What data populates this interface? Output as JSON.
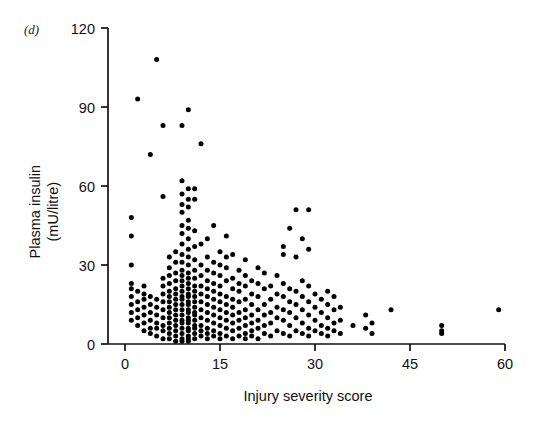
{
  "figure": {
    "panel_label": "(d)",
    "background": "#ffffff",
    "marker_color": "#000000",
    "axis_color": "#111111"
  },
  "chart_data": {
    "type": "scatter",
    "title": "",
    "xlabel": "Injury severity score",
    "ylabel": "Plasma insulin (mU/litre)",
    "ylabel_line1": "Plasma insulin",
    "ylabel_line2": "(mU/litre)",
    "xlim": [
      0,
      60
    ],
    "ylim": [
      0,
      120
    ],
    "xticks": [
      0,
      15,
      30,
      45,
      60
    ],
    "yticks": [
      0,
      30,
      60,
      90,
      120
    ],
    "xticklabels": [
      "0",
      "15",
      "30",
      "45",
      "60"
    ],
    "yticklabels": [
      "0",
      "30",
      "60",
      "90",
      "120"
    ],
    "grid": false,
    "legend": null,
    "marker": "filled-circle",
    "marker_size_px": 5,
    "n_points": 322,
    "points": [
      [
        1,
        9
      ],
      [
        1,
        12
      ],
      [
        1,
        15
      ],
      [
        1,
        18
      ],
      [
        1,
        21
      ],
      [
        1,
        23
      ],
      [
        1,
        30
      ],
      [
        1,
        41
      ],
      [
        1,
        48
      ],
      [
        2,
        7
      ],
      [
        2,
        10
      ],
      [
        2,
        13
      ],
      [
        2,
        16
      ],
      [
        2,
        20
      ],
      [
        2,
        93
      ],
      [
        3,
        5
      ],
      [
        3,
        8
      ],
      [
        3,
        11
      ],
      [
        3,
        14
      ],
      [
        3,
        17
      ],
      [
        3,
        19
      ],
      [
        3,
        22
      ],
      [
        4,
        4
      ],
      [
        4,
        6
      ],
      [
        4,
        9
      ],
      [
        4,
        12
      ],
      [
        4,
        15
      ],
      [
        4,
        18
      ],
      [
        4,
        72
      ],
      [
        5,
        3
      ],
      [
        5,
        6
      ],
      [
        5,
        8
      ],
      [
        5,
        11
      ],
      [
        5,
        14
      ],
      [
        5,
        17
      ],
      [
        5,
        108
      ],
      [
        6,
        2
      ],
      [
        6,
        5
      ],
      [
        6,
        7
      ],
      [
        6,
        10
      ],
      [
        6,
        13
      ],
      [
        6,
        16
      ],
      [
        6,
        19
      ],
      [
        6,
        22
      ],
      [
        6,
        25
      ],
      [
        6,
        56
      ],
      [
        6,
        83
      ],
      [
        7,
        2
      ],
      [
        7,
        4
      ],
      [
        7,
        6
      ],
      [
        7,
        8
      ],
      [
        7,
        10
      ],
      [
        7,
        12
      ],
      [
        7,
        14
      ],
      [
        7,
        16
      ],
      [
        7,
        18
      ],
      [
        7,
        20
      ],
      [
        7,
        23
      ],
      [
        7,
        26
      ],
      [
        7,
        29
      ],
      [
        7,
        33
      ],
      [
        8,
        1
      ],
      [
        8,
        3
      ],
      [
        8,
        5
      ],
      [
        8,
        7
      ],
      [
        8,
        9
      ],
      [
        8,
        11
      ],
      [
        8,
        13
      ],
      [
        8,
        15
      ],
      [
        8,
        17
      ],
      [
        8,
        19
      ],
      [
        8,
        21
      ],
      [
        8,
        24
      ],
      [
        8,
        27
      ],
      [
        8,
        31
      ],
      [
        8,
        35
      ],
      [
        9,
        1
      ],
      [
        9,
        2
      ],
      [
        9,
        4
      ],
      [
        9,
        6
      ],
      [
        9,
        8
      ],
      [
        9,
        9
      ],
      [
        9,
        11
      ],
      [
        9,
        13
      ],
      [
        9,
        15
      ],
      [
        9,
        17
      ],
      [
        9,
        18
      ],
      [
        9,
        20
      ],
      [
        9,
        22
      ],
      [
        9,
        24
      ],
      [
        9,
        26
      ],
      [
        9,
        28
      ],
      [
        9,
        31
      ],
      [
        9,
        34
      ],
      [
        9,
        38
      ],
      [
        9,
        42
      ],
      [
        9,
        45
      ],
      [
        9,
        50
      ],
      [
        9,
        53
      ],
      [
        9,
        57
      ],
      [
        9,
        62
      ],
      [
        9,
        83
      ],
      [
        10,
        1
      ],
      [
        10,
        2
      ],
      [
        10,
        3
      ],
      [
        10,
        5
      ],
      [
        10,
        6
      ],
      [
        10,
        8
      ],
      [
        10,
        9
      ],
      [
        10,
        10
      ],
      [
        10,
        12
      ],
      [
        10,
        13
      ],
      [
        10,
        15
      ],
      [
        10,
        16
      ],
      [
        10,
        18
      ],
      [
        10,
        19
      ],
      [
        10,
        21
      ],
      [
        10,
        23
      ],
      [
        10,
        25
      ],
      [
        10,
        27
      ],
      [
        10,
        30
      ],
      [
        10,
        33
      ],
      [
        10,
        36
      ],
      [
        10,
        40
      ],
      [
        10,
        44
      ],
      [
        10,
        47
      ],
      [
        10,
        52
      ],
      [
        10,
        55
      ],
      [
        10,
        59
      ],
      [
        10,
        89
      ],
      [
        11,
        2
      ],
      [
        11,
        4
      ],
      [
        11,
        6
      ],
      [
        11,
        7
      ],
      [
        11,
        9
      ],
      [
        11,
        11
      ],
      [
        11,
        12
      ],
      [
        11,
        14
      ],
      [
        11,
        16
      ],
      [
        11,
        18
      ],
      [
        11,
        20
      ],
      [
        11,
        22
      ],
      [
        11,
        25
      ],
      [
        11,
        28
      ],
      [
        11,
        32
      ],
      [
        11,
        37
      ],
      [
        11,
        43
      ],
      [
        11,
        55
      ],
      [
        11,
        59
      ],
      [
        12,
        3
      ],
      [
        12,
        5
      ],
      [
        12,
        7
      ],
      [
        12,
        10
      ],
      [
        12,
        13
      ],
      [
        12,
        16
      ],
      [
        12,
        19
      ],
      [
        12,
        22
      ],
      [
        12,
        26
      ],
      [
        12,
        30
      ],
      [
        12,
        38
      ],
      [
        12,
        76
      ],
      [
        13,
        2
      ],
      [
        13,
        4
      ],
      [
        13,
        6
      ],
      [
        13,
        9
      ],
      [
        13,
        12
      ],
      [
        13,
        15
      ],
      [
        13,
        18
      ],
      [
        13,
        21
      ],
      [
        13,
        24
      ],
      [
        13,
        28
      ],
      [
        13,
        33
      ],
      [
        13,
        40
      ],
      [
        14,
        3
      ],
      [
        14,
        5
      ],
      [
        14,
        8
      ],
      [
        14,
        11
      ],
      [
        14,
        14
      ],
      [
        14,
        17
      ],
      [
        14,
        20
      ],
      [
        14,
        23
      ],
      [
        14,
        27
      ],
      [
        14,
        31
      ],
      [
        14,
        45
      ],
      [
        15,
        2
      ],
      [
        15,
        4
      ],
      [
        15,
        7
      ],
      [
        15,
        10
      ],
      [
        15,
        13
      ],
      [
        15,
        16
      ],
      [
        15,
        19
      ],
      [
        15,
        22
      ],
      [
        15,
        26
      ],
      [
        15,
        30
      ],
      [
        15,
        35
      ],
      [
        16,
        3
      ],
      [
        16,
        6
      ],
      [
        16,
        9
      ],
      [
        16,
        12
      ],
      [
        16,
        15
      ],
      [
        16,
        18
      ],
      [
        16,
        24
      ],
      [
        16,
        29
      ],
      [
        16,
        33
      ],
      [
        16,
        41
      ],
      [
        17,
        2
      ],
      [
        17,
        5
      ],
      [
        17,
        8
      ],
      [
        17,
        11
      ],
      [
        17,
        14
      ],
      [
        17,
        17
      ],
      [
        17,
        21
      ],
      [
        17,
        25
      ],
      [
        17,
        34
      ],
      [
        18,
        3
      ],
      [
        18,
        6
      ],
      [
        18,
        9
      ],
      [
        18,
        12
      ],
      [
        18,
        16
      ],
      [
        18,
        20
      ],
      [
        18,
        23
      ],
      [
        18,
        28
      ],
      [
        19,
        2
      ],
      [
        19,
        4
      ],
      [
        19,
        7
      ],
      [
        19,
        10
      ],
      [
        19,
        13
      ],
      [
        19,
        17
      ],
      [
        19,
        22
      ],
      [
        19,
        26
      ],
      [
        19,
        32
      ],
      [
        20,
        3
      ],
      [
        20,
        5
      ],
      [
        20,
        8
      ],
      [
        20,
        11
      ],
      [
        20,
        15
      ],
      [
        20,
        19
      ],
      [
        20,
        24
      ],
      [
        21,
        2
      ],
      [
        21,
        6
      ],
      [
        21,
        9
      ],
      [
        21,
        13
      ],
      [
        21,
        18
      ],
      [
        21,
        23
      ],
      [
        21,
        29
      ],
      [
        22,
        4
      ],
      [
        22,
        7
      ],
      [
        22,
        11
      ],
      [
        22,
        15
      ],
      [
        22,
        21
      ],
      [
        22,
        27
      ],
      [
        23,
        3
      ],
      [
        23,
        8
      ],
      [
        23,
        12
      ],
      [
        23,
        17
      ],
      [
        23,
        22
      ],
      [
        24,
        5
      ],
      [
        24,
        10
      ],
      [
        24,
        14
      ],
      [
        24,
        19
      ],
      [
        24,
        26
      ],
      [
        25,
        4
      ],
      [
        25,
        9
      ],
      [
        25,
        13
      ],
      [
        25,
        18
      ],
      [
        25,
        23
      ],
      [
        25,
        34
      ],
      [
        25,
        37
      ],
      [
        26,
        3
      ],
      [
        26,
        7
      ],
      [
        26,
        12
      ],
      [
        26,
        16
      ],
      [
        26,
        21
      ],
      [
        26,
        44
      ],
      [
        27,
        5
      ],
      [
        27,
        10
      ],
      [
        27,
        15
      ],
      [
        27,
        20
      ],
      [
        27,
        33
      ],
      [
        27,
        51
      ],
      [
        28,
        4
      ],
      [
        28,
        8
      ],
      [
        28,
        13
      ],
      [
        28,
        18
      ],
      [
        28,
        24
      ],
      [
        28,
        40
      ],
      [
        29,
        3
      ],
      [
        29,
        6
      ],
      [
        29,
        11
      ],
      [
        29,
        16
      ],
      [
        29,
        22
      ],
      [
        29,
        36
      ],
      [
        29,
        51
      ],
      [
        30,
        5
      ],
      [
        30,
        9
      ],
      [
        30,
        14
      ],
      [
        30,
        19
      ],
      [
        31,
        4
      ],
      [
        31,
        7
      ],
      [
        31,
        12
      ],
      [
        31,
        17
      ],
      [
        32,
        3
      ],
      [
        32,
        6
      ],
      [
        32,
        10
      ],
      [
        32,
        15
      ],
      [
        32,
        20
      ],
      [
        33,
        5
      ],
      [
        33,
        8
      ],
      [
        33,
        13
      ],
      [
        33,
        18
      ],
      [
        34,
        4
      ],
      [
        34,
        9
      ],
      [
        34,
        14
      ],
      [
        36,
        7
      ],
      [
        38,
        6
      ],
      [
        38,
        11
      ],
      [
        39,
        4
      ],
      [
        39,
        8
      ],
      [
        42,
        13
      ],
      [
        50,
        4
      ],
      [
        50,
        5
      ],
      [
        50,
        7
      ],
      [
        59,
        13
      ]
    ]
  }
}
